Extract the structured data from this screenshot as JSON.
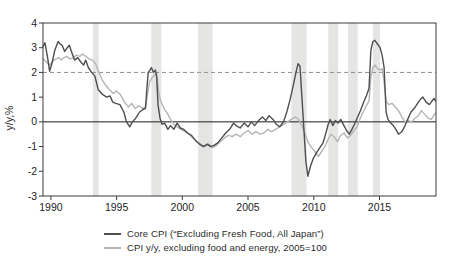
{
  "chart_data": {
    "type": "line",
    "title": "",
    "xlabel": "",
    "ylabel": "y/y,%",
    "x_range": [
      1989.4,
      2019.3
    ],
    "y_range": [
      -3,
      4
    ],
    "x_ticks": [
      "1990",
      "1995",
      "2000",
      "2005",
      "2010",
      "2015"
    ],
    "x_tick_values": [
      1990,
      1995,
      2000,
      2005,
      2010,
      2015
    ],
    "y_ticks": [
      "4",
      "3",
      "2",
      "1",
      "0",
      "-1",
      "-2",
      "-3"
    ],
    "y_tick_values": [
      4,
      3,
      2,
      1,
      0,
      -1,
      -2,
      -3
    ],
    "grid": false,
    "frame_color": "#3c3c3c",
    "background": "#ffffff",
    "zero_line": {
      "y": 0,
      "color": "#1c1c1c"
    },
    "reference_line": {
      "y": 2,
      "style": "dashed",
      "color": "#8f8f8f"
    },
    "recession_bands": {
      "color": "#e5e5e3",
      "ranges": [
        [
          1993.2,
          1993.65
        ],
        [
          1997.65,
          1998.4
        ],
        [
          2001.2,
          2002.3
        ],
        [
          2008.3,
          2009.45
        ],
        [
          2011.1,
          2011.85
        ],
        [
          2012.6,
          2013.35
        ],
        [
          2014.5,
          2015.05
        ]
      ]
    },
    "legend_position": "bottom",
    "series": [
      {
        "name": "Core CPI (“Excluding Fresh Food, All Japan”)",
        "color": "#4d4d52",
        "width": 1.4,
        "points": [
          [
            1989.4,
            3.05
          ],
          [
            1989.55,
            3.2
          ],
          [
            1989.75,
            2.6
          ],
          [
            1989.9,
            2.05
          ],
          [
            1990.1,
            2.4
          ],
          [
            1990.3,
            2.9
          ],
          [
            1990.55,
            3.25
          ],
          [
            1990.7,
            3.15
          ],
          [
            1990.85,
            3.1
          ],
          [
            1991.05,
            2.85
          ],
          [
            1991.25,
            3.0
          ],
          [
            1991.4,
            3.1
          ],
          [
            1991.6,
            2.8
          ],
          [
            1991.8,
            2.5
          ],
          [
            1992.05,
            2.6
          ],
          [
            1992.3,
            2.4
          ],
          [
            1992.5,
            2.3
          ],
          [
            1992.65,
            2.5
          ],
          [
            1992.85,
            2.2
          ],
          [
            1993.1,
            2.0
          ],
          [
            1993.35,
            1.85
          ],
          [
            1993.6,
            1.3
          ],
          [
            1993.95,
            1.1
          ],
          [
            1994.25,
            1.0
          ],
          [
            1994.5,
            1.05
          ],
          [
            1994.7,
            0.8
          ],
          [
            1994.95,
            0.75
          ],
          [
            1995.25,
            0.7
          ],
          [
            1995.55,
            0.4
          ],
          [
            1995.75,
            0.0
          ],
          [
            1996.0,
            -0.2
          ],
          [
            1996.2,
            0.0
          ],
          [
            1996.45,
            0.15
          ],
          [
            1996.75,
            0.4
          ],
          [
            1997.0,
            0.5
          ],
          [
            1997.2,
            0.55
          ],
          [
            1997.3,
            1.3
          ],
          [
            1997.4,
            2.0
          ],
          [
            1997.55,
            2.1
          ],
          [
            1997.65,
            2.2
          ],
          [
            1997.8,
            2.0
          ],
          [
            1997.95,
            2.1
          ],
          [
            1998.05,
            1.8
          ],
          [
            1998.15,
            0.7
          ],
          [
            1998.3,
            0.15
          ],
          [
            1998.45,
            -0.1
          ],
          [
            1998.65,
            -0.05
          ],
          [
            1998.9,
            -0.3
          ],
          [
            1999.1,
            -0.15
          ],
          [
            1999.35,
            -0.3
          ],
          [
            1999.6,
            -0.05
          ],
          [
            1999.85,
            -0.25
          ],
          [
            2000.1,
            -0.3
          ],
          [
            2000.4,
            -0.45
          ],
          [
            2000.7,
            -0.55
          ],
          [
            2001.0,
            -0.75
          ],
          [
            2001.3,
            -0.9
          ],
          [
            2001.6,
            -1.0
          ],
          [
            2001.9,
            -0.9
          ],
          [
            2002.15,
            -1.0
          ],
          [
            2002.4,
            -0.95
          ],
          [
            2002.7,
            -0.85
          ],
          [
            2003.0,
            -0.65
          ],
          [
            2003.3,
            -0.45
          ],
          [
            2003.6,
            -0.3
          ],
          [
            2003.9,
            -0.05
          ],
          [
            2004.1,
            -0.15
          ],
          [
            2004.4,
            -0.25
          ],
          [
            2004.7,
            -0.05
          ],
          [
            2005.0,
            -0.2
          ],
          [
            2005.25,
            0.0
          ],
          [
            2005.5,
            -0.15
          ],
          [
            2005.8,
            0.05
          ],
          [
            2006.1,
            0.2
          ],
          [
            2006.35,
            0.05
          ],
          [
            2006.6,
            0.25
          ],
          [
            2006.9,
            0.1
          ],
          [
            2007.15,
            -0.1
          ],
          [
            2007.4,
            -0.2
          ],
          [
            2007.7,
            0.0
          ],
          [
            2007.95,
            0.4
          ],
          [
            2008.2,
            0.9
          ],
          [
            2008.45,
            1.5
          ],
          [
            2008.65,
            2.0
          ],
          [
            2008.8,
            2.35
          ],
          [
            2008.95,
            2.25
          ],
          [
            2009.1,
            1.0
          ],
          [
            2009.25,
            -0.3
          ],
          [
            2009.4,
            -1.6
          ],
          [
            2009.55,
            -2.2
          ],
          [
            2009.75,
            -1.8
          ],
          [
            2009.95,
            -1.5
          ],
          [
            2010.2,
            -1.25
          ],
          [
            2010.45,
            -1.05
          ],
          [
            2010.7,
            -0.85
          ],
          [
            2010.9,
            -0.5
          ],
          [
            2011.1,
            -0.1
          ],
          [
            2011.25,
            0.1
          ],
          [
            2011.45,
            -0.15
          ],
          [
            2011.65,
            0.05
          ],
          [
            2011.85,
            -0.05
          ],
          [
            2012.05,
            0.1
          ],
          [
            2012.25,
            -0.1
          ],
          [
            2012.5,
            -0.35
          ],
          [
            2012.7,
            -0.5
          ],
          [
            2012.9,
            -0.3
          ],
          [
            2013.1,
            -0.1
          ],
          [
            2013.3,
            0.15
          ],
          [
            2013.55,
            0.45
          ],
          [
            2013.8,
            0.8
          ],
          [
            2014.0,
            1.05
          ],
          [
            2014.2,
            1.35
          ],
          [
            2014.35,
            2.9
          ],
          [
            2014.5,
            3.25
          ],
          [
            2014.65,
            3.3
          ],
          [
            2014.85,
            3.15
          ],
          [
            2015.05,
            3.0
          ],
          [
            2015.2,
            2.7
          ],
          [
            2015.35,
            2.2
          ],
          [
            2015.5,
            0.4
          ],
          [
            2015.65,
            0.1
          ],
          [
            2015.85,
            -0.05
          ],
          [
            2016.05,
            -0.15
          ],
          [
            2016.25,
            -0.3
          ],
          [
            2016.45,
            -0.5
          ],
          [
            2016.7,
            -0.4
          ],
          [
            2016.9,
            -0.2
          ],
          [
            2017.15,
            0.1
          ],
          [
            2017.4,
            0.4
          ],
          [
            2017.65,
            0.55
          ],
          [
            2017.9,
            0.75
          ],
          [
            2018.1,
            0.9
          ],
          [
            2018.3,
            1.0
          ],
          [
            2018.55,
            0.8
          ],
          [
            2018.8,
            0.7
          ],
          [
            2019.0,
            0.85
          ],
          [
            2019.15,
            0.95
          ],
          [
            2019.26,
            0.85
          ]
        ]
      },
      {
        "name": "CPI y/y, excluding food and energy, 2005=100",
        "color": "#b5b5b5",
        "width": 1.4,
        "points": [
          [
            1989.4,
            2.55
          ],
          [
            1989.6,
            2.45
          ],
          [
            1989.9,
            2.3
          ],
          [
            1990.15,
            2.45
          ],
          [
            1990.4,
            2.55
          ],
          [
            1990.6,
            2.6
          ],
          [
            1990.8,
            2.5
          ],
          [
            1991.0,
            2.6
          ],
          [
            1991.2,
            2.65
          ],
          [
            1991.45,
            2.55
          ],
          [
            1991.7,
            2.6
          ],
          [
            1991.95,
            2.7
          ],
          [
            1992.2,
            2.65
          ],
          [
            1992.4,
            2.75
          ],
          [
            1992.65,
            2.65
          ],
          [
            1992.9,
            2.55
          ],
          [
            1993.15,
            2.5
          ],
          [
            1993.4,
            2.35
          ],
          [
            1993.65,
            2.0
          ],
          [
            1993.9,
            1.7
          ],
          [
            1994.15,
            1.5
          ],
          [
            1994.45,
            1.3
          ],
          [
            1994.75,
            1.15
          ],
          [
            1995.0,
            1.25
          ],
          [
            1995.3,
            1.1
          ],
          [
            1995.6,
            0.8
          ],
          [
            1995.9,
            0.6
          ],
          [
            1996.15,
            0.75
          ],
          [
            1996.4,
            0.55
          ],
          [
            1996.7,
            0.65
          ],
          [
            1996.95,
            0.55
          ],
          [
            1997.2,
            0.6
          ],
          [
            1997.35,
            1.1
          ],
          [
            1997.5,
            1.6
          ],
          [
            1997.7,
            1.8
          ],
          [
            1997.9,
            1.9
          ],
          [
            1998.05,
            1.95
          ],
          [
            1998.2,
            1.2
          ],
          [
            1998.35,
            0.85
          ],
          [
            1998.6,
            0.55
          ],
          [
            1998.85,
            0.35
          ],
          [
            1999.1,
            0.1
          ],
          [
            1999.35,
            -0.1
          ],
          [
            1999.6,
            -0.2
          ],
          [
            1999.9,
            -0.3
          ],
          [
            2000.2,
            -0.4
          ],
          [
            2000.5,
            -0.5
          ],
          [
            2000.8,
            -0.65
          ],
          [
            2001.1,
            -0.8
          ],
          [
            2001.4,
            -0.9
          ],
          [
            2001.7,
            -1.0
          ],
          [
            2002.0,
            -0.9
          ],
          [
            2002.3,
            -1.05
          ],
          [
            2002.6,
            -0.95
          ],
          [
            2002.9,
            -0.8
          ],
          [
            2003.2,
            -0.65
          ],
          [
            2003.5,
            -0.55
          ],
          [
            2003.8,
            -0.6
          ],
          [
            2004.1,
            -0.5
          ],
          [
            2004.4,
            -0.6
          ],
          [
            2004.7,
            -0.45
          ],
          [
            2005.0,
            -0.35
          ],
          [
            2005.3,
            -0.5
          ],
          [
            2005.6,
            -0.4
          ],
          [
            2005.9,
            -0.5
          ],
          [
            2006.2,
            -0.45
          ],
          [
            2006.5,
            -0.3
          ],
          [
            2006.8,
            -0.4
          ],
          [
            2007.1,
            -0.3
          ],
          [
            2007.4,
            -0.2
          ],
          [
            2007.7,
            -0.1
          ],
          [
            2008.0,
            0.0
          ],
          [
            2008.3,
            0.1
          ],
          [
            2008.6,
            0.2
          ],
          [
            2008.85,
            0.1
          ],
          [
            2009.1,
            -0.15
          ],
          [
            2009.35,
            -0.5
          ],
          [
            2009.6,
            -0.85
          ],
          [
            2009.85,
            -1.05
          ],
          [
            2010.1,
            -1.2
          ],
          [
            2010.35,
            -1.4
          ],
          [
            2010.6,
            -1.2
          ],
          [
            2010.85,
            -1.0
          ],
          [
            2011.1,
            -0.7
          ],
          [
            2011.3,
            -0.5
          ],
          [
            2011.55,
            -0.6
          ],
          [
            2011.8,
            -0.8
          ],
          [
            2012.05,
            -0.55
          ],
          [
            2012.3,
            -0.45
          ],
          [
            2012.55,
            -0.65
          ],
          [
            2012.8,
            -0.55
          ],
          [
            2013.05,
            -0.35
          ],
          [
            2013.3,
            -0.2
          ],
          [
            2013.5,
            0.1
          ],
          [
            2013.75,
            0.4
          ],
          [
            2014.0,
            0.65
          ],
          [
            2014.2,
            0.85
          ],
          [
            2014.35,
            1.8
          ],
          [
            2014.5,
            2.2
          ],
          [
            2014.65,
            2.3
          ],
          [
            2014.85,
            2.15
          ],
          [
            2015.05,
            2.1
          ],
          [
            2015.2,
            2.15
          ],
          [
            2015.35,
            1.6
          ],
          [
            2015.5,
            0.85
          ],
          [
            2015.7,
            0.7
          ],
          [
            2015.95,
            0.75
          ],
          [
            2016.2,
            0.6
          ],
          [
            2016.45,
            0.45
          ],
          [
            2016.7,
            0.2
          ],
          [
            2016.95,
            0.0
          ],
          [
            2017.2,
            0.05
          ],
          [
            2017.45,
            0.0
          ],
          [
            2017.7,
            0.15
          ],
          [
            2017.95,
            0.25
          ],
          [
            2018.2,
            0.45
          ],
          [
            2018.45,
            0.3
          ],
          [
            2018.7,
            0.15
          ],
          [
            2018.95,
            0.1
          ],
          [
            2019.1,
            0.25
          ],
          [
            2019.26,
            0.35
          ]
        ]
      }
    ]
  }
}
